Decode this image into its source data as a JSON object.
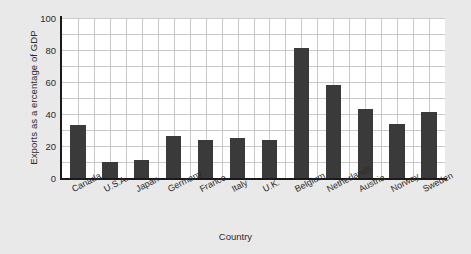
{
  "chart_data": {
    "type": "bar",
    "title": "",
    "subtitle": "",
    "xlabel": "Country",
    "ylabel": "Exports as a ercentage of GDP",
    "categories": [
      "Canada",
      "U.S.A.",
      "Japan",
      "Germany",
      "France",
      "Italy",
      "U.K.",
      "Belgium",
      "Netherlands",
      "Austria",
      "Norway",
      "Sweden"
    ],
    "values": [
      33,
      10,
      11,
      26,
      24,
      25,
      24,
      81,
      58,
      43,
      34,
      41
    ],
    "ylim": [
      0,
      100
    ],
    "yticks": [
      0,
      20,
      40,
      60,
      80,
      100
    ],
    "ytick_labels": [
      "0",
      "20",
      "40",
      "60",
      "80",
      "100"
    ],
    "grid": true,
    "grid_minor_step": 10,
    "legend": null,
    "legend_position": "none",
    "bar_color": "#3a3a3a",
    "plot_background": "#ffffff",
    "figure_background": "#e9e9e9",
    "grid_color": "#c9c9c9",
    "axis_color": "#1a1a1a",
    "text_color": "#2b2b2b"
  }
}
